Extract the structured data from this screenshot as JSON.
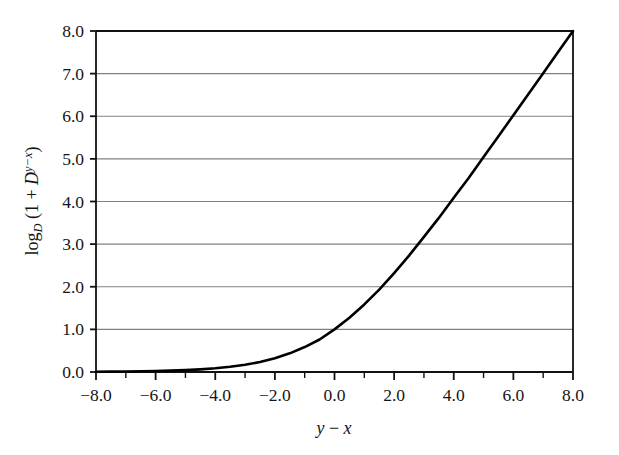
{
  "figure": {
    "background_color": "#ffffff",
    "width": 619,
    "height": 455
  },
  "chart_data": {
    "type": "line",
    "title": "",
    "subtitle": "",
    "xlabel": "y − x",
    "xlabel_parts": {
      "var1": "y",
      "operator": "−",
      "var2": "x"
    },
    "ylabel": "log_D (1 + D^(y−x))",
    "ylabel_parts": {
      "log": "log",
      "base": "D",
      "open": " (1 + ",
      "mantissa": "D",
      "exponent": "y−x",
      "close": ")"
    },
    "xlim": [
      -8.0,
      8.0
    ],
    "ylim": [
      0.0,
      8.0
    ],
    "xticks": [
      -8.0,
      -6.0,
      -4.0,
      -2.0,
      0.0,
      2.0,
      4.0,
      6.0,
      8.0
    ],
    "xtick_labels": [
      "−8.0",
      "−6.0",
      "−4.0",
      "−2.0",
      "0.0",
      "2.0",
      "4.0",
      "6.0",
      "8.0"
    ],
    "xminor_ticks": [
      -7.0,
      -5.0,
      -3.0,
      -1.0,
      1.0,
      3.0,
      5.0,
      7.0
    ],
    "yticks": [
      0.0,
      1.0,
      2.0,
      3.0,
      4.0,
      5.0,
      6.0,
      7.0,
      8.0
    ],
    "ytick_labels": [
      "0.0",
      "1.0",
      "2.0",
      "3.0",
      "4.0",
      "5.0",
      "6.0",
      "7.0",
      "8.0"
    ],
    "grid": {
      "horizontal": true,
      "vertical": false,
      "color": "#808080"
    },
    "legend": {
      "visible": false,
      "position": "none"
    },
    "line_color": "#000000",
    "line_width": 2.6,
    "series": [
      {
        "name": "log_D (1 + D^(y-x))",
        "formula": "log2(1 + 2^t)",
        "x": [
          -8.0,
          -7.5,
          -7.0,
          -6.5,
          -6.0,
          -5.5,
          -5.0,
          -4.5,
          -4.0,
          -3.5,
          -3.0,
          -2.5,
          -2.0,
          -1.5,
          -1.0,
          -0.5,
          0.0,
          0.5,
          1.0,
          1.5,
          2.0,
          2.5,
          3.0,
          3.5,
          4.0,
          4.5,
          5.0,
          5.5,
          6.0,
          6.5,
          7.0,
          7.5,
          8.0
        ],
        "values": [
          0.0056,
          0.0079,
          0.0112,
          0.0157,
          0.0222,
          0.0313,
          0.0443,
          0.0624,
          0.0875,
          0.1225,
          0.1699,
          0.2344,
          0.3219,
          0.4379,
          0.585,
          0.7631,
          1.0,
          1.2716,
          1.585,
          1.9307,
          2.3219,
          2.7297,
          3.1699,
          3.6147,
          4.0875,
          4.5532,
          5.0443,
          5.5313,
          6.0222,
          6.5157,
          7.0112,
          7.5079,
          8.0
        ]
      }
    ],
    "annotations": []
  }
}
